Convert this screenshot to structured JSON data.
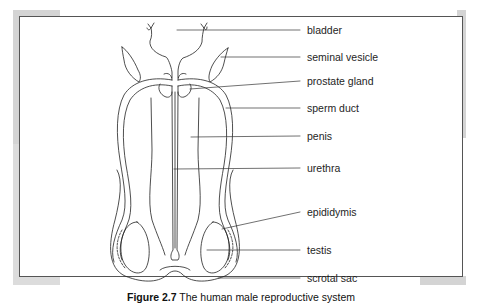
{
  "figure": {
    "caption_number": "Figure 2.7",
    "caption_text": "The human male reproductive system"
  },
  "labels": [
    {
      "id": "bladder",
      "text": "bladder",
      "y": 30
    },
    {
      "id": "seminal-vesicle",
      "text": "seminal vesicle",
      "y": 57
    },
    {
      "id": "prostate-gland",
      "text": "prostate gland",
      "y": 81
    },
    {
      "id": "sperm-duct",
      "text": "sperm duct",
      "y": 108
    },
    {
      "id": "penis",
      "text": "penis",
      "y": 136
    },
    {
      "id": "urethra",
      "text": "urethra",
      "y": 168
    },
    {
      "id": "epididymis",
      "text": "epididymis",
      "y": 212
    },
    {
      "id": "testis",
      "text": "testis",
      "y": 240
    },
    {
      "id": "scrotal-sac",
      "text": "scrotal sac",
      "y": 268
    }
  ],
  "colors": {
    "line": "#222222",
    "frame": "#555555",
    "tab": "#d4d4d4"
  }
}
